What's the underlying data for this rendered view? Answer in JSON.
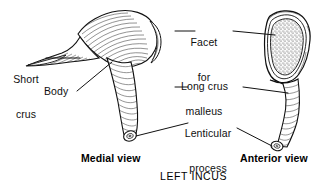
{
  "figure": {
    "caption": "LEFT INCUS",
    "background_color": "#ffffff",
    "ink_color": "#101010"
  },
  "labels": {
    "short_crus_line1": "Short",
    "short_crus_line2": "crus",
    "body": "Body",
    "facet_line1": "Facet",
    "facet_line2": "for",
    "facet_line3": "malleus",
    "long_crus": "Long crus",
    "lenticular_line1": "Lenticular",
    "lenticular_line2": "process"
  },
  "views": {
    "medial": "Medial view",
    "anterior": "Anterior view"
  }
}
